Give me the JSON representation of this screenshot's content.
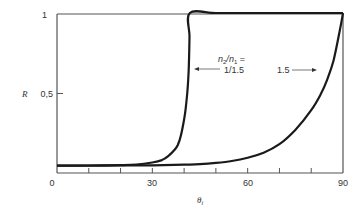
{
  "chart_data": {
    "type": "line",
    "title": "",
    "xlabel": "θi",
    "ylabel": "R",
    "xlim": [
      0,
      90
    ],
    "ylim": [
      0,
      1
    ],
    "xticks": [
      0,
      30,
      60,
      90
    ],
    "xminor_ticks": [
      10,
      20,
      40,
      50,
      70,
      80
    ],
    "yticks": [
      0.5,
      1
    ],
    "ytick_labels": [
      "0,5",
      "1"
    ],
    "xtick_labels": [
      "0",
      "30",
      "60",
      "90"
    ],
    "grid": false,
    "legend": null,
    "series": [
      {
        "name": "n2/n1 = 1/1.5",
        "x": [
          0,
          10,
          20,
          25,
          30,
          33,
          35,
          37,
          38,
          39,
          40,
          40.5,
          41,
          41.3,
          41.5,
          41.7,
          41.8,
          50,
          60,
          70,
          80,
          90
        ],
        "y": [
          0.04,
          0.041,
          0.043,
          0.047,
          0.06,
          0.075,
          0.1,
          0.14,
          0.17,
          0.23,
          0.33,
          0.4,
          0.5,
          0.58,
          0.68,
          0.85,
          1.0,
          1.0,
          1.0,
          1.0,
          1.0,
          1.0
        ]
      },
      {
        "name": "1.5",
        "x": [
          0,
          10,
          20,
          30,
          40,
          45,
          50,
          55,
          60,
          65,
          70,
          75,
          80,
          83,
          85,
          87,
          89,
          90
        ],
        "y": [
          0.04,
          0.04,
          0.041,
          0.042,
          0.046,
          0.05,
          0.057,
          0.069,
          0.089,
          0.121,
          0.175,
          0.265,
          0.389,
          0.49,
          0.58,
          0.7,
          0.89,
          1.0
        ]
      }
    ],
    "annotations": [
      {
        "text_parts": [
          "n2/n1 =",
          "1/1.5"
        ],
        "points_to": "n2/n1 = 1/1.5",
        "arrow": "left"
      },
      {
        "text": "1.5",
        "points_to": "1.5",
        "arrow": "right"
      }
    ]
  },
  "labels": {
    "ylabel": "R",
    "xlabel_main": "θ",
    "xlabel_sub": "i",
    "y_tick_1": "1",
    "y_tick_half": "0,5",
    "x_tick_0": "0",
    "x_tick_30": "30",
    "x_tick_60": "60",
    "x_tick_90": "90",
    "annot1_n2": "n",
    "annot1_sub2": "2",
    "annot1_slash": "/",
    "annot1_n1": "n",
    "annot1_sub1": "1",
    "annot1_eq": " =",
    "annot1_line2": "1/1.5",
    "annot2": "1.5"
  },
  "colors": {
    "curve": "#1a1a1a",
    "axis": "#555555",
    "text": "#333333"
  }
}
